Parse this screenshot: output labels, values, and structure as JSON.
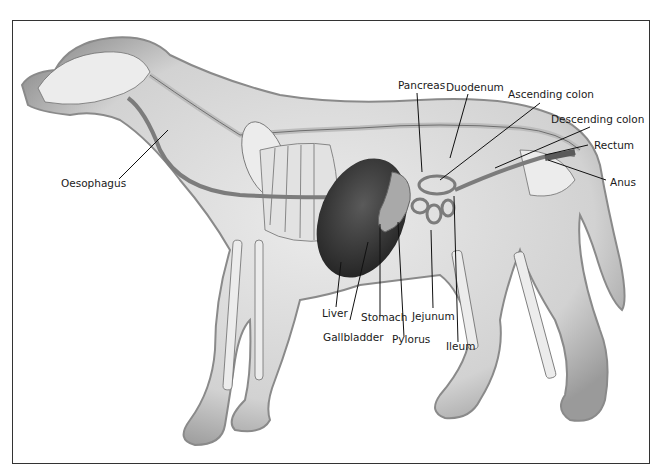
{
  "figure": {
    "colors": {
      "body_fill": "#d6d6d6",
      "body_edge": "#8a8a8a",
      "bone_fill": "#ececec",
      "bone_edge": "#6e6e6e",
      "gut": "#7c7c7c",
      "liver": "#3a3a3a",
      "leader_line": "#111111",
      "border": "#333333"
    }
  },
  "labels": {
    "oesophagus": "Oesophagus",
    "pancreas": "Pancreas",
    "duodenum": "Duodenum",
    "ascending_colon": "Ascending colon",
    "descending_colon": "Descending colon",
    "rectum": "Rectum",
    "anus": "Anus",
    "liver": "Liver",
    "gallbladder": "Gallbladder",
    "stomach": "Stomach",
    "pylorus": "Pylorus",
    "jejunum": "Jejunum",
    "ileum": "Ileum"
  }
}
